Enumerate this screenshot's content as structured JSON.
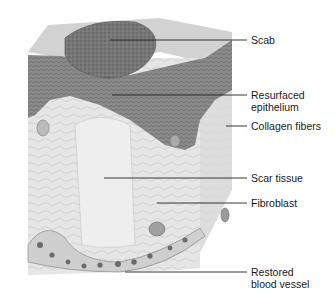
{
  "figure": {
    "colors": {
      "epithelium": "#7a7a7a",
      "scab": "#6e6e6e",
      "dermis": "#e4e4e4",
      "top_surface": "#cfcfcf",
      "leader_line": "#222222",
      "label_text": "#1a1a1a"
    }
  },
  "labels": [
    {
      "id": "scab",
      "line1": "Scab",
      "line2": ""
    },
    {
      "id": "resurfaced-epithelium",
      "line1": "Resurfaced",
      "line2": "epithelium"
    },
    {
      "id": "collagen-fibers",
      "line1": "Collagen fibers",
      "line2": ""
    },
    {
      "id": "scar-tissue",
      "line1": "Scar tissue",
      "line2": ""
    },
    {
      "id": "fibroblast",
      "line1": "Fibroblast",
      "line2": ""
    },
    {
      "id": "restored-blood-vessel",
      "line1": "Restored",
      "line2": "blood vessel"
    }
  ]
}
